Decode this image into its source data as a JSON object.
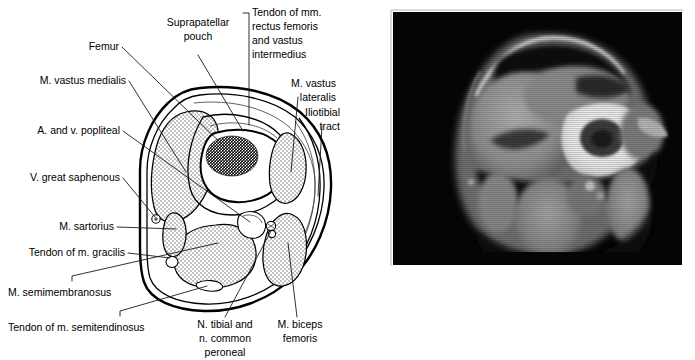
{
  "figure": {
    "panels": [
      {
        "id": "diagram",
        "kind": "labeled-line-drawing"
      },
      {
        "id": "mri",
        "kind": "grayscale-mr-image"
      }
    ]
  },
  "labels": {
    "femur": "Femur",
    "suprapatellar_pouch_l1": "Suprapatellar",
    "suprapatellar_pouch_l2": "pouch",
    "tendon_rf_vi_l1": "Tendon of mm.",
    "tendon_rf_vi_l2": "rectus femoris",
    "tendon_rf_vi_l3": "and vastus",
    "tendon_rf_vi_l4": "intermedius",
    "vastus_medialis": "M. vastus medialis",
    "vastus_lateralis_l1": "M. vastus",
    "vastus_lateralis_l2": "lateralis",
    "iliotibial_tract_l1": "Iliotibial",
    "iliotibial_tract_l2": "tract",
    "popliteal_vessels": "A. and v. popliteal",
    "great_saphenous": "V. great saphenous",
    "sartorius": "M. sartorius",
    "gracilis_tendon": "Tendon of m. gracilis",
    "semimembranosus": "M. semimembranosus",
    "semitendinosus_tendon": "Tendon of m. semitendinosus",
    "tibial_peroneal_l1": "N. tibial and",
    "tibial_peroneal_l2": "n. common",
    "tibial_peroneal_l3": "peroneal",
    "biceps_femoris_l1": "M. biceps",
    "biceps_femoris_l2": "femoris"
  },
  "colors": {
    "background": "#ffffff",
    "ink": "#000000",
    "leader": "#1a1a1a",
    "muscle_fill": "#d4d0cb",
    "muscle_stipple": "#8c8880",
    "bone_cortex": "#ffffff",
    "marrow_stipple": "#111111",
    "mri_background": "#050505",
    "mri_bright": "#f2f2f2",
    "mri_mid": "#9a9a9a",
    "mri_dark": "#2a2a2a"
  }
}
